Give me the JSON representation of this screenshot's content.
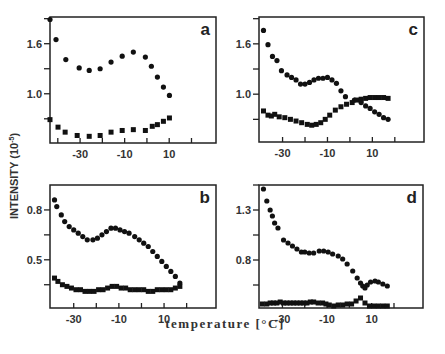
{
  "figure": {
    "ylabel_main": "INTENSITY (10",
    "ylabel_exp": "-5",
    "ylabel_close": ")",
    "xlabel": "temperature [°C]",
    "colors": {
      "frame": "#222222",
      "marker": "#111111",
      "text": "#333333"
    }
  },
  "chart_data": [
    {
      "panel": "a",
      "type": "scatter",
      "xlabel": "temperature [°C]",
      "ylabel": "INTENSITY (10^-5)",
      "xticks": [
        -30,
        -10,
        10
      ],
      "yticks": [
        1.0,
        1.6
      ],
      "xlim": [
        -43.5,
        31
      ],
      "ylim": [
        0.41,
        1.92
      ],
      "frame_px": [
        50,
        17,
        216,
        143
      ],
      "series": [
        {
          "name": "circles",
          "marker": "circle",
          "x": [
            -43.5,
            -40.8,
            -36.4,
            -30.4,
            -25.9,
            -21.0,
            -16.1,
            -11.1,
            -6.1,
            -0.7,
            2.0,
            4.7,
            7.4,
            10.1
          ],
          "y": [
            1.89,
            1.65,
            1.41,
            1.31,
            1.28,
            1.3,
            1.38,
            1.45,
            1.5,
            1.44,
            1.33,
            1.2,
            1.08,
            0.98
          ]
        },
        {
          "name": "squares",
          "marker": "square",
          "x": [
            -43.5,
            -39.9,
            -36.7,
            -31.3,
            -25.9,
            -21.0,
            -16.1,
            -11.1,
            -6.1,
            -0.7,
            2.4,
            4.7,
            7.4,
            10.1
          ],
          "y": [
            0.69,
            0.6,
            0.54,
            0.5,
            0.49,
            0.5,
            0.54,
            0.56,
            0.57,
            0.56,
            0.61,
            0.63,
            0.67,
            0.71
          ]
        }
      ]
    },
    {
      "panel": "c",
      "type": "scatter",
      "xlabel": "temperature [°C]",
      "ylabel": "INTENSITY (10^-5)",
      "xticks": [
        -30,
        -10,
        10
      ],
      "yticks": [
        1.0,
        1.6
      ],
      "xlim": [
        -40.5,
        33
      ],
      "ylim": [
        0.43,
        1.92
      ],
      "frame_px": [
        259,
        17,
        424,
        142
      ],
      "series": [
        {
          "name": "circles",
          "marker": "circle",
          "x": [
            -38.5,
            -36.5,
            -34.5,
            -32.5,
            -30.5,
            -28,
            -26,
            -24,
            -22,
            -20,
            -18,
            -16,
            -14,
            -12,
            -10,
            -8,
            -6,
            -4,
            -2,
            2,
            5,
            7,
            9,
            11,
            13,
            15,
            17
          ],
          "y": [
            1.76,
            1.59,
            1.45,
            1.4,
            1.28,
            1.23,
            1.2,
            1.17,
            1.12,
            1.12,
            1.14,
            1.17,
            1.19,
            1.19,
            1.2,
            1.17,
            1.13,
            1.04,
            0.97,
            0.93,
            0.9,
            0.86,
            0.83,
            0.79,
            0.76,
            0.72,
            0.7
          ],
          "note": "circles descend past crossover near 0°C"
        },
        {
          "name": "squares",
          "marker": "square",
          "x": [
            -38.5,
            -36.5,
            -35,
            -33.5,
            -31.5,
            -29,
            -26.5,
            -24,
            -21.5,
            -19,
            -17,
            -15,
            -13,
            -11,
            -9,
            -6.5,
            -4,
            -1.5,
            1,
            3,
            5,
            7,
            9,
            11,
            13,
            15,
            17
          ],
          "y": [
            0.8,
            0.75,
            0.74,
            0.76,
            0.73,
            0.72,
            0.7,
            0.68,
            0.66,
            0.64,
            0.63,
            0.64,
            0.66,
            0.7,
            0.75,
            0.81,
            0.85,
            0.88,
            0.9,
            0.93,
            0.94,
            0.95,
            0.96,
            0.96,
            0.96,
            0.96,
            0.95
          ]
        }
      ]
    },
    {
      "panel": "b",
      "type": "scatter",
      "xlabel": "temperature [°C]",
      "ylabel": "INTENSITY (10^-5)",
      "xticks": [
        -30,
        -10,
        10
      ],
      "yticks": [
        0.5,
        0.8
      ],
      "xlim": [
        -40.5,
        33
      ],
      "ylim": [
        0.21,
        0.95
      ],
      "frame_px": [
        50,
        185,
        216,
        308
      ],
      "series": [
        {
          "name": "circles",
          "marker": "circle",
          "x": [
            -38.5,
            -37.5,
            -35.5,
            -34,
            -32,
            -30,
            -28,
            -26,
            -24,
            -21.5,
            -19.5,
            -17.5,
            -15.5,
            -13.5,
            -11.5,
            -9.5,
            -7.5,
            -5.5,
            -3,
            -1,
            1,
            3,
            5,
            7,
            9,
            11,
            13,
            15,
            17
          ],
          "y": [
            0.86,
            0.82,
            0.77,
            0.73,
            0.7,
            0.68,
            0.66,
            0.64,
            0.62,
            0.62,
            0.63,
            0.65,
            0.67,
            0.69,
            0.69,
            0.68,
            0.67,
            0.66,
            0.64,
            0.62,
            0.6,
            0.58,
            0.55,
            0.52,
            0.49,
            0.46,
            0.43,
            0.4,
            0.36
          ]
        },
        {
          "name": "squares",
          "marker": "square",
          "x": [
            -38.5,
            -37,
            -35,
            -33,
            -31,
            -29,
            -27,
            -25,
            -23,
            -21,
            -19,
            -17,
            -15,
            -13,
            -11,
            -9,
            -7,
            -5,
            -3,
            -1,
            1,
            3,
            5,
            7,
            9,
            11,
            13,
            15,
            17
          ],
          "y": [
            0.39,
            0.37,
            0.35,
            0.34,
            0.33,
            0.32,
            0.32,
            0.31,
            0.31,
            0.31,
            0.32,
            0.32,
            0.33,
            0.34,
            0.34,
            0.33,
            0.33,
            0.32,
            0.32,
            0.32,
            0.32,
            0.31,
            0.31,
            0.32,
            0.32,
            0.32,
            0.32,
            0.33,
            0.34
          ]
        }
      ]
    },
    {
      "panel": "d",
      "type": "scatter",
      "xlabel": "temperature [°C]",
      "ylabel": "INTENSITY (10^-5)",
      "xticks": [
        -30,
        -10,
        10
      ],
      "yticks": [
        0.8,
        1.3
      ],
      "xlim": [
        -40.5,
        33
      ],
      "ylim": [
        0.32,
        1.55
      ],
      "frame_px": [
        259,
        185,
        423,
        308
      ],
      "series": [
        {
          "name": "circles",
          "marker": "circle",
          "x": [
            -38.5,
            -37,
            -35.5,
            -34.5,
            -33.5,
            -32,
            -29.5,
            -27.5,
            -25.5,
            -23.5,
            -21.5,
            -20,
            -18,
            -16,
            -13.5,
            -11.5,
            -9.5,
            -7.5,
            -5,
            -3,
            -1,
            1.5,
            3.5,
            5,
            6,
            7,
            8,
            9.5,
            11.5,
            13,
            15,
            17
          ],
          "y": [
            1.51,
            1.39,
            1.3,
            1.24,
            1.17,
            1.12,
            1.0,
            0.97,
            0.94,
            0.91,
            0.88,
            0.88,
            0.87,
            0.87,
            0.89,
            0.89,
            0.88,
            0.86,
            0.84,
            0.81,
            0.76,
            0.69,
            0.62,
            0.57,
            0.54,
            0.52,
            0.55,
            0.58,
            0.59,
            0.58,
            0.56,
            0.54
          ]
        },
        {
          "name": "squares",
          "marker": "square",
          "x": [
            -39,
            -37,
            -35.5,
            -34,
            -32.5,
            -31,
            -29.5,
            -28,
            -26.5,
            -25,
            -23.5,
            -22,
            -20.5,
            -19,
            -17.5,
            -16,
            -14,
            -12,
            -10.5,
            -9,
            -7,
            -5,
            -3,
            -1,
            1,
            3,
            5,
            7,
            9,
            11,
            13,
            15,
            17
          ],
          "y": [
            0.36,
            0.36,
            0.37,
            0.37,
            0.37,
            0.38,
            0.37,
            0.37,
            0.37,
            0.37,
            0.37,
            0.37,
            0.37,
            0.37,
            0.38,
            0.38,
            0.37,
            0.37,
            0.36,
            0.35,
            0.34,
            0.35,
            0.35,
            0.36,
            0.36,
            0.39,
            0.42,
            0.37,
            0.34,
            0.34,
            0.34,
            0.34,
            0.34
          ]
        }
      ]
    }
  ],
  "panel_labels": [
    "a",
    "c",
    "b",
    "d"
  ]
}
